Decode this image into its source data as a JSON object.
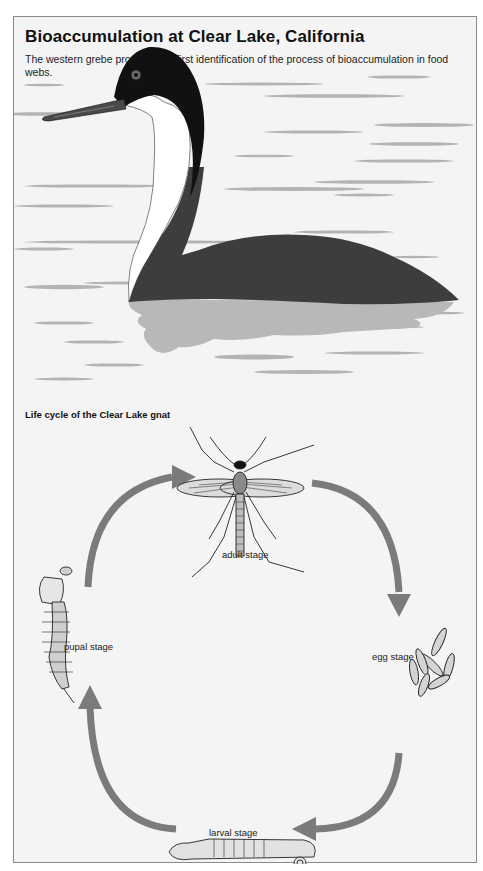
{
  "header": {
    "title": "Bioaccumulation at Clear Lake, California",
    "subtitle": "The western grebe provided the first identification of the process of bioaccumulation in food webs."
  },
  "illustration": {
    "subject": "western grebe swimming on lake",
    "colors": {
      "background": "#f4f4f4",
      "water_ripple": "#b3b3b3",
      "bird_body": "#3d3d3d",
      "bird_head": "#111111",
      "bird_neck": "#ffffff",
      "reflection": "#b8b8b8",
      "arrow": "#7b7b7b"
    }
  },
  "lifecycle": {
    "title": "Life cycle of the Clear Lake gnat",
    "stages": [
      {
        "id": "adult",
        "label": "adult stage"
      },
      {
        "id": "egg",
        "label": "egg stage"
      },
      {
        "id": "larval",
        "label": "larval stage"
      },
      {
        "id": "pupal",
        "label": "pupal stage"
      }
    ],
    "flow": [
      "adult",
      "egg",
      "larval",
      "pupal",
      "adult"
    ]
  }
}
